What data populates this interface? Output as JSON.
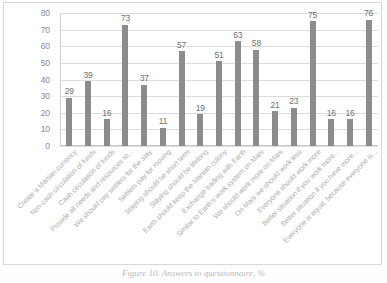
{
  "figure": {
    "caption": "Figure 10. Answers to questionnaire, %"
  },
  "chart_data": {
    "type": "bar",
    "title": "",
    "xlabel": "",
    "ylabel": "",
    "ylim": [
      0,
      80
    ],
    "yticks": [
      0,
      10,
      20,
      30,
      40,
      50,
      60,
      70,
      80
    ],
    "grid": true,
    "legend": "none",
    "bar_color": "#8c8c8c",
    "categories": [
      "Create a Martian currency",
      "Non-cash circulation of funds",
      "Cash circulation of funds",
      "Provide all needs and resources to...",
      "We should pay settlers for the stay",
      "Settlers pay for moving",
      "Staying should be short term",
      "Staying should be lifelong",
      "Earth should keep the Martian colony",
      "Exchange trading with Earth",
      "Similar to Earth's work system on Mars",
      "We should work more on Mars",
      "On Mars we should work less",
      "Everyone should work more",
      "Better situation if you work more...",
      "Better situation if you have more...",
      "Everyone is equal, because everyone is..."
    ],
    "values": [
      29,
      39,
      16,
      73,
      37,
      11,
      57,
      19,
      51,
      63,
      58,
      21,
      23,
      75,
      16,
      16,
      76
    ]
  }
}
